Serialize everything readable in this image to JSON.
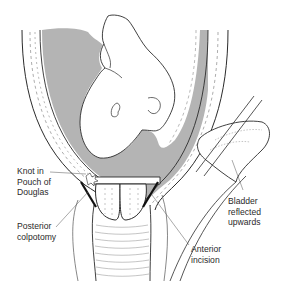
{
  "figure": {
    "colors": {
      "line": "#2b2b2b",
      "fluid_shading": "#b4b4b4",
      "background": "#ffffff",
      "dashed_tissue": "#8a8a8a"
    },
    "labels": [
      {
        "id": "knot",
        "text": "Knot in\nPouch of\nDouglas"
      },
      {
        "id": "posterior",
        "text": "Posterior\ncolpotomy"
      },
      {
        "id": "bladder",
        "text": "Bladder\nreflected\nupwards"
      },
      {
        "id": "anterior",
        "text": "Anterior\nincision"
      }
    ]
  }
}
